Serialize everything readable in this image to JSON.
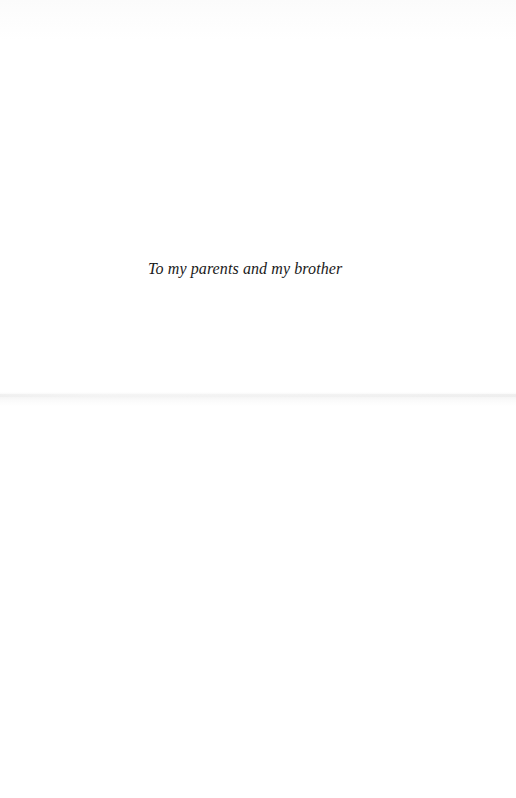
{
  "page": {
    "type": "dedication",
    "dedication_text": "To my parents and my brother"
  },
  "colors": {
    "paper": "#ffffff",
    "text": "#1a1a1a"
  }
}
